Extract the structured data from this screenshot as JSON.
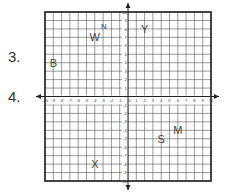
{
  "questions": [
    {
      "number": "3.",
      "x": 8,
      "y": 48
    },
    {
      "number": "4.",
      "x": 8,
      "y": 88
    }
  ],
  "grid": {
    "x_min": -10,
    "x_max": 10,
    "y_min": -10,
    "y_max": 10,
    "left": 45,
    "top": 12,
    "right": 211,
    "bottom": 181,
    "line_color": "#555555",
    "frame_color": "#222222",
    "axis_color": "#222222",
    "x_tick_labels": [
      "-10",
      "-9",
      "-8",
      "-7",
      "-6",
      "-5",
      "-4",
      "-3",
      "-2",
      "-1",
      "0",
      "1",
      "2",
      "3",
      "4",
      "5",
      "6",
      "7",
      "8",
      "9",
      "10"
    ],
    "y_tick_labels": [
      "10",
      "9",
      "8",
      "7",
      "6",
      "5",
      "4",
      "3",
      "2",
      "1",
      "-1",
      "-2",
      "-3",
      "-4",
      "-5",
      "-6",
      "-7",
      "-8",
      "-9",
      "-10"
    ]
  },
  "points": [
    {
      "label": "W",
      "x": -4,
      "y": 7,
      "size": "normal"
    },
    {
      "label": "N",
      "x": -2.9,
      "y": 8.2,
      "size": "small"
    },
    {
      "label": "Y",
      "x": 2,
      "y": 8,
      "size": "normal"
    },
    {
      "label": "B",
      "x": -9,
      "y": 4,
      "size": "normal"
    },
    {
      "label": "S",
      "x": 4,
      "y": -5,
      "size": "normal"
    },
    {
      "label": "M",
      "x": 6,
      "y": -4,
      "size": "normal"
    },
    {
      "label": "X",
      "x": -4,
      "y": -8,
      "size": "normal"
    }
  ]
}
